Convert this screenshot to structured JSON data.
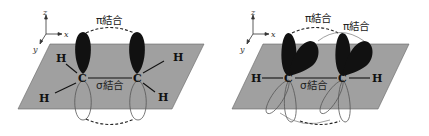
{
  "colors": {
    "plane": "#a0a0a0",
    "plane_edge": "#555555",
    "p_orbital_filled": "#111111",
    "p_orbital_outline": "#555555",
    "bond_line": "#111111",
    "background": "#ffffff"
  },
  "left_panel": {
    "axes": {
      "z": "z",
      "x": "x",
      "y": "y"
    },
    "pi_bond_label": "π結合",
    "sigma_bond_label": "σ結合",
    "carbons": [
      "C",
      "C"
    ],
    "hydrogens": [
      "H",
      "H",
      "H",
      "H"
    ]
  },
  "right_panel": {
    "axes": {
      "z": "z",
      "x": "x",
      "y": "y"
    },
    "pi_bond_labels": [
      "π結合",
      "π結合"
    ],
    "sigma_bond_label": "σ結合",
    "carbons": [
      "C",
      "C"
    ],
    "hydrogens": [
      "H",
      "H"
    ]
  }
}
